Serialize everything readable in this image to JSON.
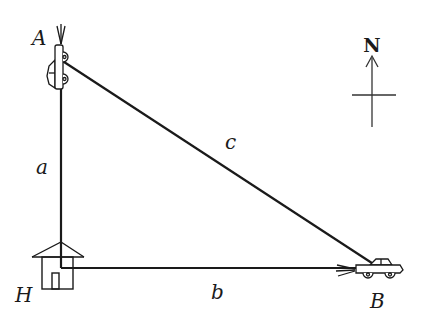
{
  "diagram": {
    "type": "right-triangle-word-problem",
    "labels": {
      "vertex_a": "A",
      "vertex_b": "B",
      "vertex_h": "H",
      "side_a": "a",
      "side_b": "b",
      "side_c": "c",
      "north": "N"
    },
    "points": {
      "A": {
        "x": 61,
        "y": 60
      },
      "H": {
        "x": 61,
        "y": 268
      },
      "B": {
        "x": 378,
        "y": 268
      }
    },
    "objects": {
      "car_a": "car at point A heading north",
      "house_h": "house at point H",
      "car_b": "car at point B heading east"
    },
    "colors": {
      "stroke": "#1a1a1a",
      "background": "#ffffff"
    }
  }
}
